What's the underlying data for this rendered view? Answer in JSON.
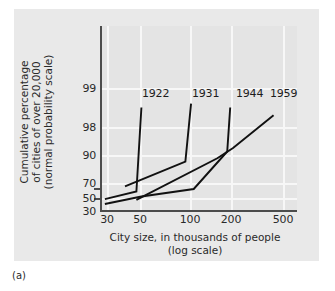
{
  "caption": "(a)",
  "chart_data": {
    "type": "line",
    "title": "",
    "xlabel": "City size, in thousands of people",
    "xlabel_line2": "(log scale)",
    "ylabel": "Cumulative percentage",
    "ylabel_line2": "of cities of over 20,000",
    "ylabel_line3": "(normal probability scale)",
    "x_scale": "log",
    "y_scale": "normal probability",
    "xlim": [
      25,
      600
    ],
    "ylim": [
      30,
      99.5
    ],
    "grid": true,
    "legend_position": "inline-above-curves",
    "x_ticks": [
      {
        "value": 30,
        "label": "30"
      },
      {
        "value": 50,
        "label": "50"
      },
      {
        "value": 100,
        "label": "100"
      },
      {
        "value": 200,
        "label": "200"
      },
      {
        "value": 500,
        "label": "500"
      }
    ],
    "y_ticks": [
      {
        "value": 99,
        "label": "99"
      },
      {
        "value": 98,
        "label": "98"
      },
      {
        "value": 90,
        "label": "90"
      },
      {
        "value": 70,
        "label": "70"
      },
      {
        "value": 50,
        "label": "50"
      },
      {
        "value": 30,
        "label": "30"
      }
    ],
    "series": [
      {
        "name": "1922",
        "label": "1922",
        "points": [
          {
            "x": 29,
            "y": 48
          },
          {
            "x": 48,
            "y": 63
          },
          {
            "x": 52,
            "y": 98.5
          }
        ]
      },
      {
        "name": "1931",
        "label": "1931",
        "points": [
          {
            "x": 40,
            "y": 71
          },
          {
            "x": 105,
            "y": 86
          },
          {
            "x": 115,
            "y": 98.6
          }
        ]
      },
      {
        "name": "1944",
        "label": "1944",
        "points": [
          {
            "x": 29,
            "y": 40
          },
          {
            "x": 52,
            "y": 53
          },
          {
            "x": 120,
            "y": 68
          },
          {
            "x": 205,
            "y": 91
          },
          {
            "x": 215,
            "y": 98.5
          }
        ]
      },
      {
        "name": "1959",
        "label": "1959",
        "points": [
          {
            "x": 48,
            "y": 47
          },
          {
            "x": 175,
            "y": 88
          },
          {
            "x": 225,
            "y": 92
          },
          {
            "x": 430,
            "y": 98.3
          }
        ]
      }
    ],
    "series_labels": [
      {
        "text": "1922",
        "x": 155,
        "y": 94
      },
      {
        "text": "1931",
        "x": 205,
        "y": 94
      },
      {
        "text": "1944",
        "x": 249,
        "y": 94
      },
      {
        "text": "1959",
        "x": 283,
        "y": 94
      }
    ],
    "colors": {
      "panel_background": "#e9e9e9",
      "plot_background": "#e4e4e4",
      "gridline": "#f7f7f7",
      "axis": "#4c4c4c",
      "line": "#111111",
      "text": "#2a2a2a"
    }
  }
}
